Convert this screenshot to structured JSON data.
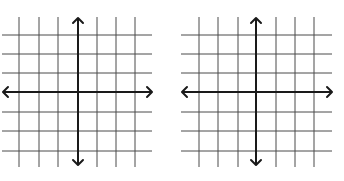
{
  "planes": [
    {
      "name": "coordinate-plane-left",
      "offset_x": 0,
      "vertical_lines": [
        19,
        39,
        58,
        97,
        116,
        135
      ],
      "horizontal_lines": [
        35,
        54,
        73,
        112,
        131,
        151
      ],
      "y_axis_x": 78,
      "x_axis_y": 92,
      "grid_x_range": [
        2,
        152
      ],
      "grid_y_range": [
        17,
        167
      ],
      "axis_x_range": [
        3,
        152
      ],
      "axis_y_range": [
        18,
        165
      ]
    },
    {
      "name": "coordinate-plane-right",
      "offset_x": 0,
      "vertical_lines": [
        199,
        218,
        238,
        276,
        295,
        314
      ],
      "horizontal_lines": [
        35,
        54,
        73,
        112,
        131,
        151
      ],
      "y_axis_x": 256,
      "x_axis_y": 92,
      "grid_x_range": [
        181,
        332
      ],
      "grid_y_range": [
        17,
        167
      ],
      "axis_x_range": [
        182,
        332
      ],
      "axis_y_range": [
        18,
        165
      ]
    }
  ],
  "colors": {
    "grid": "#4a4a4a",
    "axis": "#1a1a1a",
    "background": "#ffffff"
  }
}
